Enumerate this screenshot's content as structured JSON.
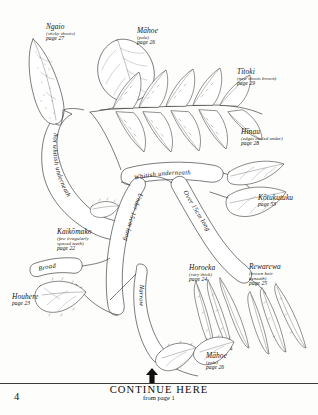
{
  "document": {
    "page_number": "4",
    "type": "botanical-identification-key",
    "footer": {
      "continue_label": "CONTINUE HERE",
      "from_label": "from page 1",
      "arrow_icon": "up-arrow-icon"
    }
  },
  "branch_labels": [
    {
      "id": "not-whitish-underneath",
      "text": "Not whitish underneath"
    },
    {
      "id": "whitish-underneath",
      "text": "Whitish underneath"
    },
    {
      "id": "under-15cm-long",
      "text": "Under 15cm long"
    },
    {
      "id": "over-15cm-long",
      "text": "Over 15cm long"
    },
    {
      "id": "narrow",
      "text": "Narrow"
    },
    {
      "id": "broad",
      "text": "Broad"
    }
  ],
  "species": [
    {
      "id": "ngaio",
      "name": "Ngaio",
      "note": "(sticky shoots)",
      "page": "page 27"
    },
    {
      "id": "mahoe-top",
      "name": "Māhoe",
      "note": "(pale)",
      "page": "page 26"
    },
    {
      "id": "titoki",
      "name": "Tītoki",
      "note": "(new shoots brown)",
      "page": "page 29"
    },
    {
      "id": "hinau",
      "name": "Hīnau",
      "note": "(edges curled under)",
      "page": "page 28"
    },
    {
      "id": "kotukutuku",
      "name": "Kōtukutuku",
      "note": "",
      "page": "page 53"
    },
    {
      "id": "kaikomako",
      "name": "Kaikōmako",
      "note": "(few irregularly\nspaced teeth)",
      "page": "page 22"
    },
    {
      "id": "houhere",
      "name": "Houhere",
      "note": "",
      "page": "page 23"
    },
    {
      "id": "horoeka",
      "name": "Horoeka",
      "note": "(very thick)",
      "page": "page 24"
    },
    {
      "id": "rewarewa",
      "name": "Rewarewa",
      "note": "(brown hair\nbeneath)",
      "page": "page 25"
    },
    {
      "id": "mahoe-bottom",
      "name": "Māhoe",
      "note": "(pale)",
      "page": "page 26"
    }
  ],
  "species_text": {
    "ngaio": {
      "name": "Ngaio",
      "note": "(sticky shoots)",
      "page": "page 27"
    },
    "mahoe_top": {
      "name": "Māhoe",
      "note": "(pale)",
      "page": "page 26"
    },
    "titoki": {
      "name": "Tītoki",
      "note": "(new shoots brown)",
      "page": "page 29"
    },
    "hinau": {
      "name": "Hīnau",
      "note": "(edges curled under)",
      "page": "page 28"
    },
    "kotukutuku": {
      "name": "Kōtukutuku",
      "note": "",
      "page": "page 53"
    },
    "kaikomako": {
      "name": "Kaikōmako",
      "note1": "(few irregularly",
      "note2": "spaced teeth)",
      "page": "page 22"
    },
    "houhere": {
      "name": "Houhere",
      "note": "",
      "page": "page 23"
    },
    "horoeka": {
      "name": "Horoeka",
      "note": "(very thick)",
      "page": "page 24"
    },
    "rewarewa": {
      "name": "Rewarewa",
      "note1": "(brown hair",
      "note2": "beneath)",
      "page": "page 25"
    },
    "mahoe_bottom": {
      "name": "Māhoe",
      "note": "(pale)",
      "page": "page 26"
    }
  },
  "colors": {
    "ink": "#2a2622",
    "paper": "#fdfdfc",
    "rule": "#3b3b3b"
  }
}
